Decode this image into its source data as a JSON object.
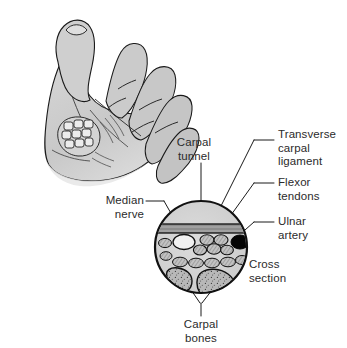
{
  "labels": {
    "carpal_tunnel": "Carpal\ntunnel",
    "transverse_carpal_ligament": "Transverse\ncarpal\nligament",
    "flexor_tendons": "Flexor\ntendons",
    "ulnar_artery": "Ulnar\nartery",
    "cross_section": "Cross\nsection",
    "median_nerve": "Median\nnerve",
    "carpal_bones": "Carpal\nbones"
  },
  "colors": {
    "line": "#1a1a1a",
    "text": "#2b2b2b",
    "skin_fill": "#c9c9c9",
    "skin_fill_light": "#d8d8d8",
    "section_fill": "#d2d2d2",
    "ligament_fill": "#a8a8a8",
    "bone_fill": "#b4b4b4",
    "tendon_fill": "#bdbdbd",
    "artery_fill": "#000000",
    "nerve_fill": "#e8e8e8",
    "background": "#ffffff"
  },
  "diagram": {
    "circle": {
      "cx": 201,
      "cy": 247,
      "r": 46
    },
    "structures": [
      {
        "name": "transverse-carpal-ligament",
        "shape": "hatched-band",
        "position": "top"
      },
      {
        "name": "median-nerve",
        "shape": "open-oval",
        "position": "upper-left"
      },
      {
        "name": "flexor-tendons",
        "shape": "oval-cluster",
        "position": "upper-center"
      },
      {
        "name": "ulnar-artery",
        "shape": "solid-oval",
        "position": "upper-right"
      },
      {
        "name": "carpal-bones",
        "shape": "stippled-blobs",
        "position": "bottom",
        "count": 2
      }
    ]
  }
}
